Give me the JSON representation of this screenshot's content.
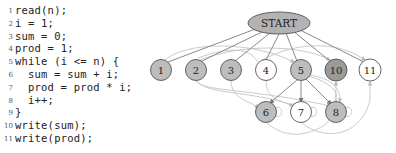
{
  "code": {
    "lines": [
      {
        "num": "1",
        "text": "read(n);",
        "indent": 0
      },
      {
        "num": "2",
        "text": "i = 1;",
        "indent": 0
      },
      {
        "num": "3",
        "text": "sum = 0;",
        "indent": 0
      },
      {
        "num": "4",
        "text": "prod = 1;",
        "indent": 0
      },
      {
        "num": "5",
        "text": "while (i <= n) {",
        "indent": 0
      },
      {
        "num": "6",
        "text": "sum = sum + i;",
        "indent": 1
      },
      {
        "num": "7",
        "text": "prod = prod * i;",
        "indent": 1
      },
      {
        "num": "8",
        "text": "i++;",
        "indent": 1
      },
      {
        "num": "9",
        "text": "}",
        "indent": 0
      },
      {
        "num": "10",
        "text": "write(sum);",
        "indent": 0
      },
      {
        "num": "11",
        "text": "write(prod);",
        "indent": 0
      }
    ]
  },
  "graph": {
    "start": {
      "label": "START",
      "fill": "#b3b3b3"
    },
    "nodes": [
      {
        "id": "1",
        "label": "1",
        "fill": "#bdbdbd"
      },
      {
        "id": "2",
        "label": "2",
        "fill": "#bdbdbd"
      },
      {
        "id": "3",
        "label": "3",
        "fill": "#bdbdbd"
      },
      {
        "id": "4",
        "label": "4",
        "fill": "#ffffff"
      },
      {
        "id": "5",
        "label": "5",
        "fill": "#bdbdbd"
      },
      {
        "id": "10",
        "label": "10",
        "fill": "#9a9a9a"
      },
      {
        "id": "11",
        "label": "11",
        "fill": "#ffffff"
      },
      {
        "id": "6",
        "label": "6",
        "fill": "#bdbdbd"
      },
      {
        "id": "7",
        "label": "7",
        "fill": "#ffffff"
      },
      {
        "id": "8",
        "label": "8",
        "fill": "#bdbdbd"
      }
    ],
    "edge_color_dark": "#777777",
    "edge_color_light": "#bbbbbb"
  }
}
